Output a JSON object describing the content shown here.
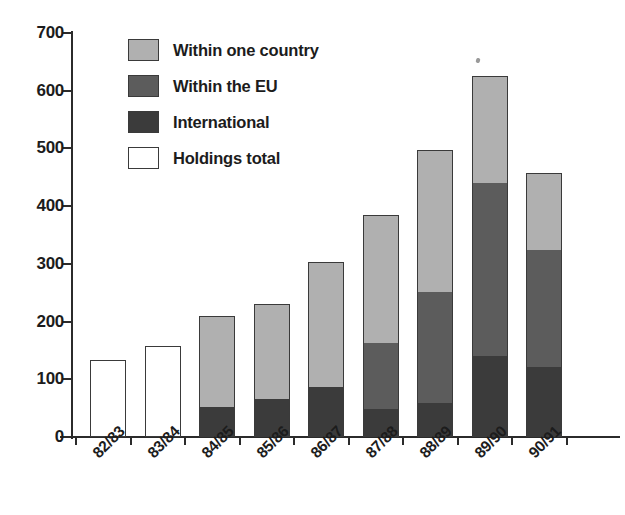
{
  "chart_data": {
    "type": "bar",
    "subtype": "stacked",
    "title": "",
    "xlabel": "",
    "ylabel": "",
    "ylim": [
      0,
      700
    ],
    "ytick_values": [
      0,
      100,
      200,
      300,
      400,
      500,
      600,
      700
    ],
    "ytick_labels": [
      "0",
      "100",
      "200",
      "300",
      "400",
      "500",
      "600",
      "700"
    ],
    "grid": false,
    "legend_position": "top-left-inside",
    "categories": [
      "82/83",
      "83/84",
      "84/85",
      "85/86",
      "86/87",
      "87/88",
      "88/89",
      "89/90",
      "90/91"
    ],
    "series": [
      {
        "name": "Within one country",
        "color": "#b0b0b0",
        "values": [
          0,
          0,
          158,
          165,
          217,
          222,
          246,
          185,
          133
        ]
      },
      {
        "name": "Within the EU",
        "color": "#5c5c5c",
        "values": [
          0,
          0,
          0,
          0,
          0,
          115,
          192,
          300,
          203
        ]
      },
      {
        "name": "International",
        "color": "#3b3b3b",
        "values": [
          0,
          0,
          52,
          66,
          87,
          48,
          59,
          140,
          121
        ]
      },
      {
        "name": "Holdings total",
        "color": "#ffffff",
        "values": [
          133,
          157,
          0,
          0,
          0,
          0,
          0,
          0,
          0
        ]
      }
    ],
    "totals": [
      133,
      157,
      210,
      231,
      304,
      385,
      497,
      625,
      457
    ]
  },
  "legend": {
    "items": [
      {
        "label": "Within one country",
        "swatch": "#b0b0b0",
        "name": "within-one-country"
      },
      {
        "label": "Within the EU",
        "swatch": "#5c5c5c",
        "name": "within-the-eu"
      },
      {
        "label": "International",
        "swatch": "#3b3b3b",
        "name": "international"
      },
      {
        "label": "Holdings total",
        "swatch": "#ffffff",
        "name": "holdings-total"
      }
    ]
  },
  "axes": {
    "y_ticks": [
      "700",
      "600",
      "500",
      "400",
      "300",
      "200",
      "100",
      "0"
    ],
    "x_ticks": [
      "82/83",
      "83/84",
      "84/85",
      "85/86",
      "86/87",
      "87/88",
      "88/89",
      "89/90",
      "90/91"
    ]
  }
}
